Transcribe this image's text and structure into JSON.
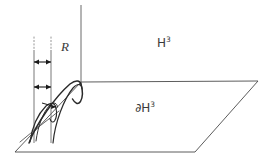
{
  "figure": {
    "background_color": "#ffffff",
    "stroke_color": "#4a4a4a",
    "text_color": "#3a3a3a",
    "width": 273,
    "height": 165
  },
  "labels": {
    "radius": {
      "text": "R",
      "style": "italic-serif",
      "x": 66,
      "y": 47
    },
    "interior": {
      "base": "H",
      "exponent": "3",
      "full_text": "ℍ³",
      "meaning": "hyperbolic-3-space",
      "x": 165,
      "y": 44
    },
    "boundary": {
      "base": "∂H",
      "exponent": "3",
      "full_text": "∂ℍ³",
      "meaning": "boundary-of-hyperbolic-3-space",
      "x": 147,
      "y": 109
    }
  },
  "geometry": {
    "boundary_plane": {
      "name": "boundary-plane",
      "points": "15,152 81,82 258,81 195,152"
    },
    "vertical_axis": {
      "name": "vertical-axis",
      "x": 81,
      "y_top": 5,
      "y_bottom": 83
    },
    "measure_lines": [
      {
        "name": "measure-line-left",
        "x": 34,
        "y_dot_top": 37,
        "y_dot_bottom": 50,
        "y_bottom": 143
      },
      {
        "name": "measure-line-right",
        "x": 51,
        "y_dot_top": 37,
        "y_dot_bottom": 50,
        "y_bottom": 143
      }
    ],
    "measure_arrows": [
      {
        "name": "measure-arrow-upper",
        "x1": 34,
        "x2": 51,
        "y": 62
      },
      {
        "name": "measure-arrow-lower",
        "x1": 34,
        "x2": 51,
        "y": 87
      }
    ],
    "geodesics": [
      {
        "name": "geodesic-arc-outer",
        "path": "M 29,143 C 40,122 58,96 72,83 C 77,79 80,80 81,83"
      },
      {
        "name": "geodesic-arc-inner",
        "path": "M 29,143 C 44,117 62,95 74,86 C 79,82 82,84 82,88"
      },
      {
        "name": "geodesic-arc-small-left",
        "path": "M 33,128 C 39,112 46,103 53,100 C 57,99 58,102 58,106"
      },
      {
        "name": "geodesic-arc-small-left-2",
        "path": "M 34,127 C 41,110 49,102 55,101 C 59,101 60,104 59,108"
      },
      {
        "name": "geodesic-cusp-right",
        "path": "M 81,83 C 82,90 82,96 80,101 C 78,104 75,103 73,99"
      },
      {
        "name": "geodesic-chord-lower",
        "path": "M 22,141 C 35,129 48,119 58,110"
      }
    ]
  }
}
